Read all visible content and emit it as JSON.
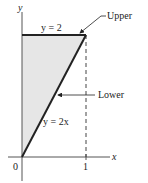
{
  "diagram": {
    "axes": {
      "x_label": "x",
      "y_label": "y",
      "origin_label": "0",
      "x_tick_label": "1"
    },
    "curves": {
      "upper": {
        "equation_label": "y = 2",
        "callout": "Upper"
      },
      "lower": {
        "equation_label": "y = 2x",
        "callout": "Lower"
      }
    },
    "region": {
      "fill_color": "#e6e6e6",
      "description": "Shaded region between y = 2x and y = 2 for 0 ≤ x ≤ 1"
    },
    "colors": {
      "line": "#222222",
      "shade": "#e6e6e6"
    }
  }
}
